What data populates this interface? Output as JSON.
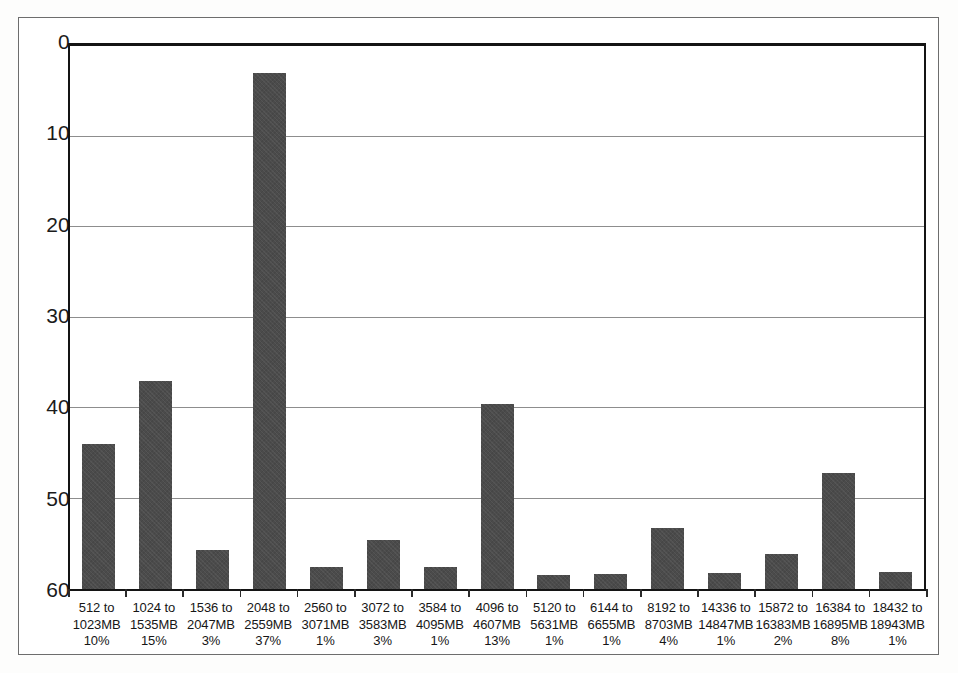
{
  "chart_data": {
    "type": "bar",
    "title": "",
    "xlabel": "",
    "ylabel": "",
    "ylim": [
      0,
      60
    ],
    "yticks": [
      0,
      10,
      20,
      30,
      40,
      50,
      60
    ],
    "grid": true,
    "legend": "none",
    "orientation": "vertical",
    "bar_color": "#4b4b4b",
    "categories": [
      "512 to 1023MB",
      "1024 to 1535MB",
      "1536 to 2047MB",
      "2048 to 2559MB",
      "2560 to 3071MB",
      "3072 to 3583MB",
      "3584 to 4095MB",
      "4096 to 4607MB",
      "5120 to 5631MB",
      "6144 to 6655MB",
      "8192 to 8703MB",
      "14336 to 14847MB",
      "15872 to 16383MB",
      "16384 to 16895MB",
      "18432 to 18943MB"
    ],
    "values": [
      16.0,
      23.0,
      4.3,
      57.0,
      2.4,
      5.4,
      2.4,
      20.4,
      1.6,
      1.7,
      6.7,
      1.8,
      3.9,
      12.8,
      1.9
    ],
    "percent_labels": [
      "10%",
      "15%",
      "3%",
      "37%",
      "1%",
      "3%",
      "1%",
      "13%",
      "1%",
      "1%",
      "4%",
      "1%",
      "2%",
      "8%",
      "1%"
    ],
    "categories_lines": [
      [
        "512 to",
        "1023MB"
      ],
      [
        "1024 to",
        "1535MB"
      ],
      [
        "1536 to",
        "2047MB"
      ],
      [
        "2048 to",
        "2559MB"
      ],
      [
        "2560 to",
        "3071MB"
      ],
      [
        "3072 to",
        "3583MB"
      ],
      [
        "3584 to",
        "4095MB"
      ],
      [
        "4096 to",
        "4607MB"
      ],
      [
        "5120 to",
        "5631MB"
      ],
      [
        "6144 to",
        "6655MB"
      ],
      [
        "8192 to",
        "8703MB"
      ],
      [
        "14336 to",
        "14847MB"
      ],
      [
        "15872 to",
        "16383MB"
      ],
      [
        "16384 to",
        "16895MB"
      ],
      [
        "18432 to",
        "18943MB"
      ]
    ]
  },
  "axis": {
    "y_tick_labels": [
      "60",
      "50",
      "40",
      "30",
      "20",
      "10",
      "0"
    ]
  }
}
